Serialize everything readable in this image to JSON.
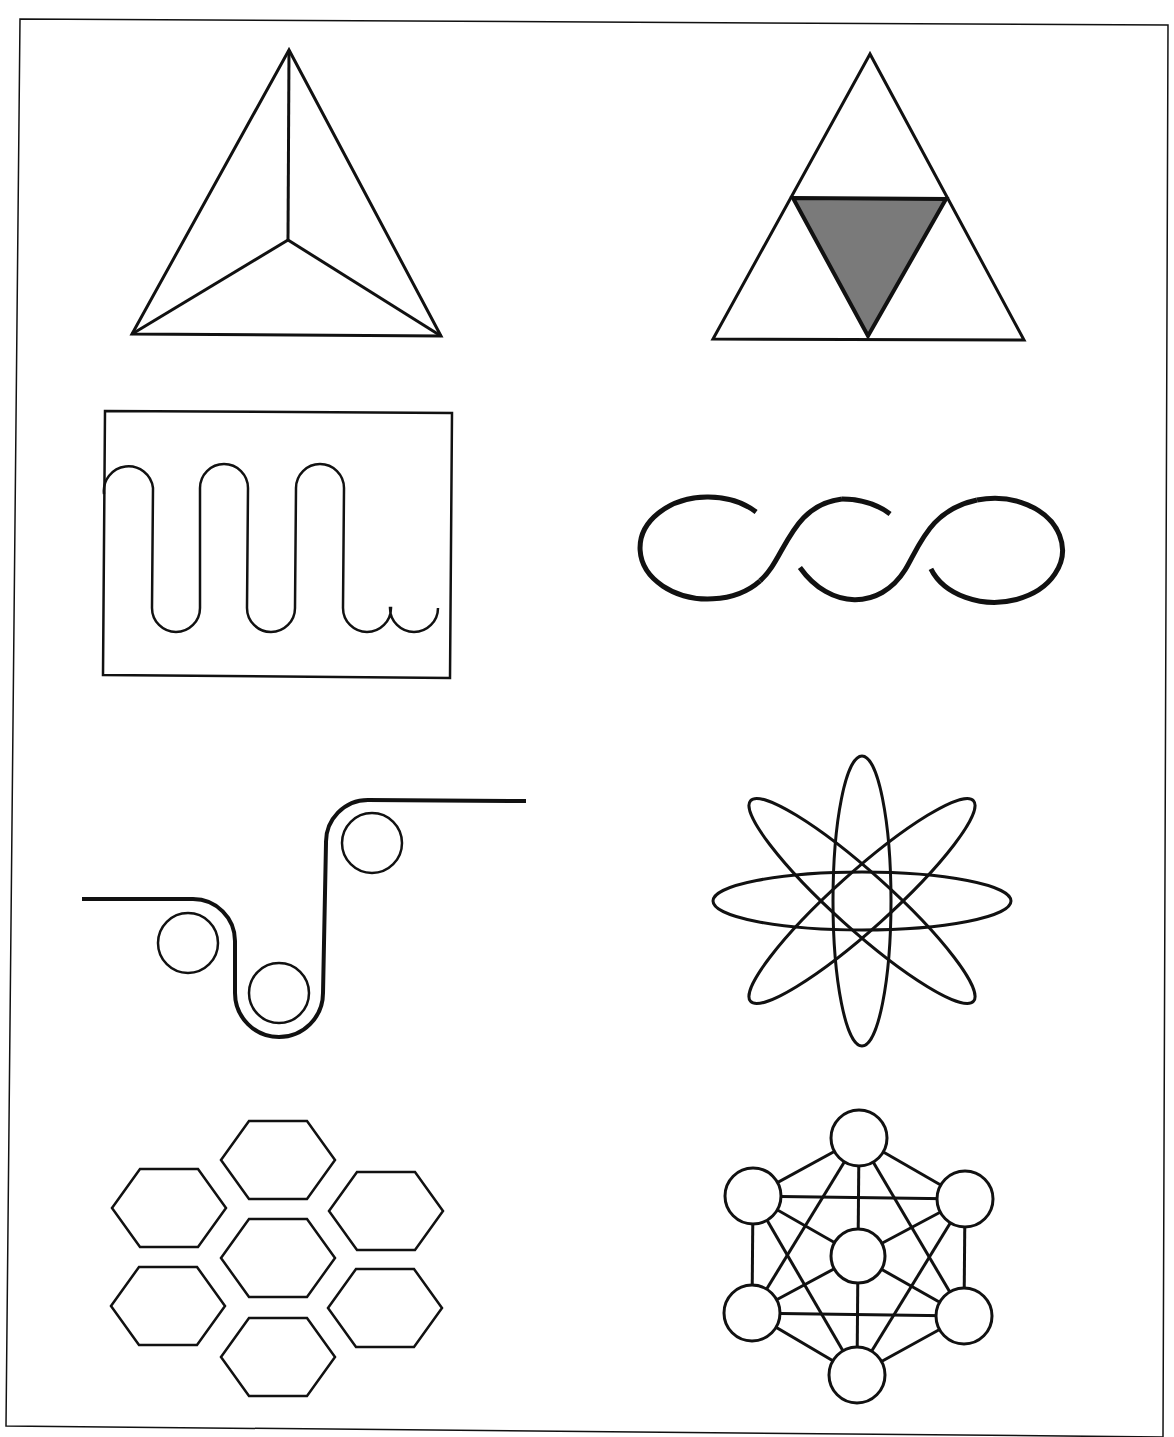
{
  "page": {
    "width": 1174,
    "height": 1437,
    "background": "#ffffff",
    "ink_color": "#111111",
    "fill_gray": "#7a7a7a",
    "frame": {
      "points": [
        [
          20,
          19
        ],
        [
          1168,
          25
        ],
        [
          1163,
          1437
        ],
        [
          6,
          1426
        ]
      ],
      "stroke_width": 1.5
    }
  },
  "figures": [
    {
      "id": "tetrahedron",
      "label": "triangle with three lines meeting at an interior point",
      "outer": [
        [
          289,
          50
        ],
        [
          132,
          334
        ],
        [
          441,
          336
        ]
      ],
      "center": [
        288,
        240
      ],
      "stroke_width": 3
    },
    {
      "id": "triforce",
      "label": "triangle subdivided with shaded inverted center triangle",
      "outer": [
        [
          870,
          54
        ],
        [
          713,
          339
        ],
        [
          1024,
          340
        ]
      ],
      "inner_shaded": [
        [
          793,
          198
        ],
        [
          946,
          199
        ],
        [
          868,
          336
        ]
      ],
      "fill": "#7a7a7a",
      "stroke_width": 3
    },
    {
      "id": "serpentine-box",
      "label": "square containing a serpentine wave",
      "box": [
        [
          105,
          411
        ],
        [
          452,
          413
        ],
        [
          450,
          678
        ],
        [
          103,
          675
        ]
      ],
      "wave": {
        "start_x": 104,
        "end_x": 446,
        "top_y": 464,
        "bottom_y": 632,
        "lobe_radius": 24,
        "up_centers_x": [
          129,
          224,
          320
        ],
        "down_centers_x": [
          176,
          271,
          367,
          414
        ]
      },
      "stroke_width": 2.5
    },
    {
      "id": "twisted-loops",
      "label": "three linked loops with over-under crossings",
      "loops": [
        {
          "cx": 708,
          "cy": 548,
          "rx": 68,
          "ry": 51
        },
        {
          "cx": 842,
          "cy": 550,
          "rx": 68,
          "ry": 51
        },
        {
          "cx": 977,
          "cy": 551,
          "rx": 68,
          "ry": 52
        }
      ],
      "stroke_width": 5
    },
    {
      "id": "roller-path",
      "label": "belt passing over three rollers",
      "rollers": [
        {
          "cx": 188,
          "cy": 943,
          "r": 30
        },
        {
          "cx": 279,
          "cy": 993,
          "r": 30
        },
        {
          "cx": 372,
          "cy": 843,
          "r": 30
        }
      ],
      "stroke_width": 4
    },
    {
      "id": "atom",
      "label": "four overlapping ellipses forming an atom symbol",
      "center": [
        862,
        901
      ],
      "ellipses": [
        {
          "rx": 149,
          "ry": 29,
          "rotate": 0
        },
        {
          "rx": 145,
          "ry": 29,
          "rotate": 90
        },
        {
          "rx": 150,
          "ry": 28,
          "rotate": 42
        },
        {
          "rx": 150,
          "ry": 28,
          "rotate": -42
        }
      ],
      "stroke_width": 3
    },
    {
      "id": "honeycomb",
      "label": "seven separated hexagons in honeycomb arrangement",
      "hexagons": [
        {
          "cx": 278,
          "cy": 1160
        },
        {
          "cx": 169,
          "cy": 1208
        },
        {
          "cx": 386,
          "cy": 1211
        },
        {
          "cx": 278,
          "cy": 1258
        },
        {
          "cx": 168,
          "cy": 1306
        },
        {
          "cx": 385,
          "cy": 1308
        },
        {
          "cx": 278,
          "cy": 1357
        }
      ],
      "half_width": 57,
      "half_height": 39,
      "stroke_width": 2.5
    },
    {
      "id": "node-network",
      "label": "seven circles fully connected in hexagonal network",
      "nodes": [
        {
          "cx": 859,
          "cy": 1138,
          "r": 28
        },
        {
          "cx": 753,
          "cy": 1196,
          "r": 28
        },
        {
          "cx": 965,
          "cy": 1199,
          "r": 28
        },
        {
          "cx": 858,
          "cy": 1256,
          "r": 27
        },
        {
          "cx": 752,
          "cy": 1313,
          "r": 28
        },
        {
          "cx": 964,
          "cy": 1316,
          "r": 28
        },
        {
          "cx": 857,
          "cy": 1375,
          "r": 28
        }
      ],
      "edges": [
        [
          0,
          1
        ],
        [
          0,
          2
        ],
        [
          0,
          3
        ],
        [
          0,
          4
        ],
        [
          0,
          5
        ],
        [
          1,
          2
        ],
        [
          1,
          3
        ],
        [
          1,
          4
        ],
        [
          1,
          6
        ],
        [
          2,
          3
        ],
        [
          2,
          5
        ],
        [
          2,
          6
        ],
        [
          3,
          4
        ],
        [
          3,
          5
        ],
        [
          3,
          6
        ],
        [
          4,
          5
        ],
        [
          4,
          6
        ],
        [
          5,
          6
        ]
      ],
      "stroke_width": 3
    }
  ]
}
